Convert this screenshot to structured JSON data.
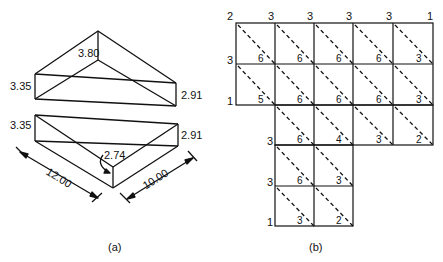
{
  "figure_a": {
    "caption": "(a)",
    "top_wedge": {
      "apex_height": "3.80",
      "left_height": "3.35",
      "right_height": "2.91"
    },
    "bottom_block": {
      "left_height": "3.35",
      "right_height": "2.91",
      "front_height": "2.74",
      "length": "12.00",
      "width": "10.00"
    }
  },
  "figure_b": {
    "caption": "(b)",
    "top_node_labels": [
      "2",
      "3",
      "3",
      "3",
      "3",
      "1"
    ],
    "left_node_labels": [
      "3",
      "1",
      "3",
      "3",
      "1"
    ],
    "rows": [
      {
        "cols": [
          0,
          1,
          2,
          3,
          4
        ],
        "values": [
          "6",
          "6",
          "6",
          "6",
          "3"
        ]
      },
      {
        "cols": [
          0,
          1,
          2,
          3,
          4
        ],
        "values": [
          "5",
          "6",
          "6",
          "6",
          "3"
        ]
      },
      {
        "cols": [
          1,
          2,
          3,
          4
        ],
        "values": [
          "6",
          "4",
          "3",
          "2"
        ]
      },
      {
        "cols": [
          1,
          2
        ],
        "values": [
          "6",
          "3"
        ]
      },
      {
        "cols": [
          1,
          2
        ],
        "values": [
          "3",
          "2"
        ]
      }
    ]
  }
}
